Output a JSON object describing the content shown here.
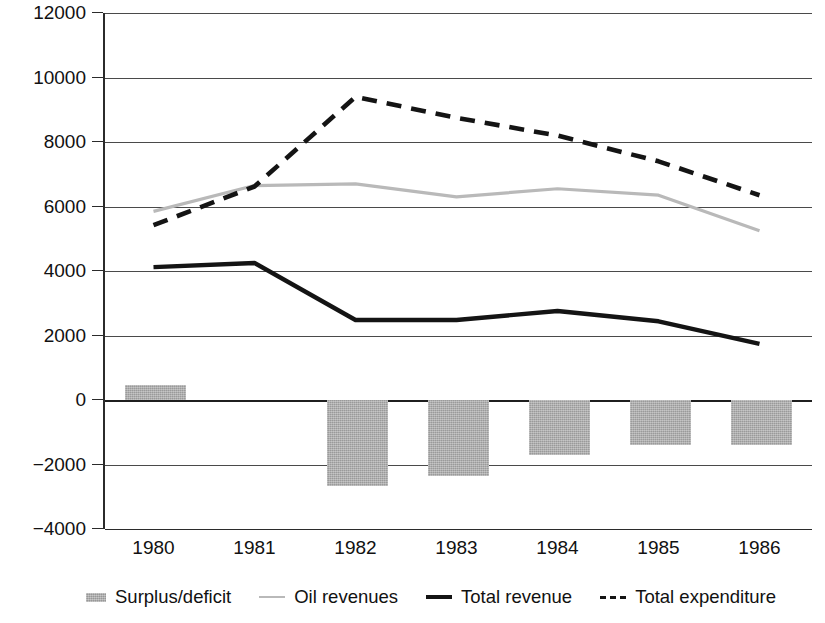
{
  "chart_data": {
    "type": "line",
    "title": "",
    "xlabel": "",
    "ylabel": "",
    "categories": [
      "1980",
      "1981",
      "1982",
      "1983",
      "1984",
      "1985",
      "1986"
    ],
    "ylim": [
      -4000,
      12000
    ],
    "ytick_step": 2000,
    "yticks": [
      "12000",
      "10000",
      "8000",
      "6000",
      "4000",
      "2000",
      "0",
      "−2000",
      "−4000"
    ],
    "grid": true,
    "legend_position": "bottom",
    "series": [
      {
        "name": "Surplus/deficit",
        "type": "bar",
        "color": "#a9a9a9",
        "values": [
          450,
          0,
          -2670,
          -2360,
          -1720,
          -1390,
          -1410
        ]
      },
      {
        "name": "Oil revenues",
        "type": "line",
        "color": "#b9b9b9",
        "style": "solid",
        "values": [
          5850,
          6650,
          6700,
          6300,
          6550,
          6350,
          5250
        ]
      },
      {
        "name": "Total revenue",
        "type": "line",
        "color": "#141414",
        "style": "solid",
        "values": [
          4120,
          4250,
          2480,
          2480,
          2760,
          2440,
          1740
        ]
      },
      {
        "name": "Total expenditure",
        "type": "line",
        "color": "#141414",
        "style": "dashed",
        "values": [
          5420,
          6620,
          9400,
          8750,
          8200,
          7400,
          6350
        ]
      }
    ]
  },
  "legend": {
    "items": [
      {
        "label": "Surplus/deficit",
        "swatch": "bar-swatch-gray"
      },
      {
        "label": "Oil revenues",
        "swatch": "line-swatch-light-gray"
      },
      {
        "label": "Total revenue",
        "swatch": "line-swatch-solid-black"
      },
      {
        "label": "Total expenditure",
        "swatch": "line-swatch-dashed-black"
      }
    ]
  }
}
